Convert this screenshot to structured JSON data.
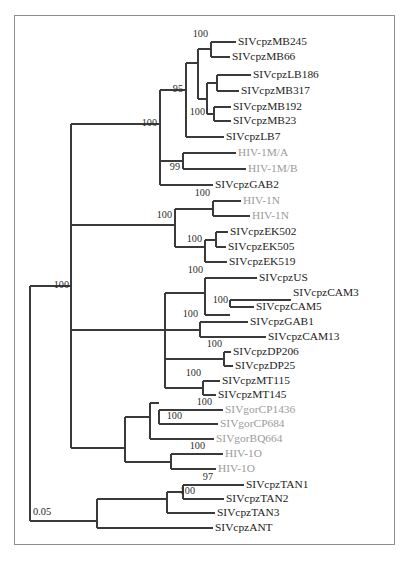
{
  "figure": {
    "type": "phylogenetic-tree",
    "frame": {
      "x": 14,
      "y": 15,
      "width": 381,
      "height": 530,
      "border_color": "#8d8d8d"
    },
    "colors": {
      "branch": "#3a3a3a",
      "tip_text": "#1c1c1c",
      "tip_text_highlight": "#9b9b9b",
      "support_text": "#2b2b2b",
      "background": "#ffffff"
    },
    "scale_bar": {
      "label": "0.05",
      "x1": 30,
      "x2": 70,
      "y": 521,
      "text_x": 33,
      "text_y": 513
    }
  },
  "chart_data": {
    "type": "tree",
    "title": "",
    "orientation": "left-to-right-rectangular",
    "scale_bar_units": 0.05,
    "tip_count": 30,
    "taxa": [
      {
        "label": "SIVcpzMB245",
        "y": 42,
        "x": 238,
        "color": "dark"
      },
      {
        "label": "SIVcpzMB66",
        "y": 57,
        "x": 232,
        "color": "dark"
      },
      {
        "label": "SIVcpzLB186",
        "y": 75,
        "x": 253,
        "color": "dark"
      },
      {
        "label": "SIVcpzMB317",
        "y": 91,
        "x": 241,
        "color": "dark"
      },
      {
        "label": "SIVcpzMB192",
        "y": 107,
        "x": 233,
        "color": "dark"
      },
      {
        "label": "SIVcpzMB23",
        "y": 121,
        "x": 233,
        "color": "dark"
      },
      {
        "label": "SIVcpzLB7",
        "y": 137,
        "x": 226,
        "color": "dark"
      },
      {
        "label": "HIV-1M/A",
        "y": 153,
        "x": 238,
        "color": "gray"
      },
      {
        "label": "HIV-1M/B",
        "y": 169,
        "x": 248,
        "color": "gray"
      },
      {
        "label": "SIVcpzGAB2",
        "y": 185,
        "x": 215,
        "color": "dark"
      },
      {
        "label": "HIV-1N",
        "y": 201,
        "x": 243,
        "color": "gray"
      },
      {
        "label": "HIV-1N",
        "y": 216,
        "x": 252,
        "color": "gray"
      },
      {
        "label": "SIVcpzEK502",
        "y": 232,
        "x": 230,
        "color": "dark"
      },
      {
        "label": "SIVcpzEK505",
        "y": 247,
        "x": 228,
        "color": "dark"
      },
      {
        "label": "SIVcpzEK519",
        "y": 262,
        "x": 229,
        "color": "dark"
      },
      {
        "label": "SIVcpzUS",
        "y": 278,
        "x": 259,
        "color": "dark"
      },
      {
        "label": "SIVcpzCAM3",
        "y": 293,
        "x": 293,
        "color": "dark"
      },
      {
        "label": "SIVcpzCAM5",
        "y": 307,
        "x": 256,
        "color": "dark"
      },
      {
        "label": "SIVcpzGAB1",
        "y": 322,
        "x": 250,
        "color": "dark"
      },
      {
        "label": "SIVcpzCAM13",
        "y": 337,
        "x": 268,
        "color": "dark"
      },
      {
        "label": "SIVcpzDP206",
        "y": 352,
        "x": 233,
        "color": "dark"
      },
      {
        "label": "SIVcpzDP25",
        "y": 366,
        "x": 235,
        "color": "dark"
      },
      {
        "label": "SIVcpzMT115",
        "y": 381,
        "x": 222,
        "color": "dark"
      },
      {
        "label": "SIVcpzMT145",
        "y": 395,
        "x": 218,
        "color": "dark"
      },
      {
        "label": "SIVgorCP1436",
        "y": 410,
        "x": 225,
        "color": "gray"
      },
      {
        "label": "SIVgorCP684",
        "y": 424,
        "x": 220,
        "color": "gray"
      },
      {
        "label": "SIVgorBQ664",
        "y": 439,
        "x": 216,
        "color": "gray"
      },
      {
        "label": "HIV-1O",
        "y": 454,
        "x": 225,
        "color": "gray"
      },
      {
        "label": "HIV-1O",
        "y": 469,
        "x": 218,
        "color": "gray"
      },
      {
        "label": "SIVcpzTAN1",
        "y": 485,
        "x": 246,
        "color": "dark"
      },
      {
        "label": "SIVcpzTAN2",
        "y": 499,
        "x": 226,
        "color": "dark"
      },
      {
        "label": "SIVcpzTAN3",
        "y": 513,
        "x": 217,
        "color": "dark"
      },
      {
        "label": "SIVcpzANT",
        "y": 528,
        "x": 215,
        "color": "dark"
      }
    ],
    "support_values": [
      {
        "value": "100",
        "x": 208,
        "y": 35,
        "anchor": "end"
      },
      {
        "value": "95",
        "x": 183,
        "y": 90,
        "anchor": "end"
      },
      {
        "value": "100",
        "x": 205,
        "y": 113,
        "anchor": "end"
      },
      {
        "value": "100",
        "x": 157,
        "y": 124,
        "anchor": "end"
      },
      {
        "value": "99",
        "x": 180,
        "y": 168,
        "anchor": "end"
      },
      {
        "value": "100",
        "x": 210,
        "y": 194,
        "anchor": "end"
      },
      {
        "value": "100",
        "x": 172,
        "y": 216,
        "anchor": "end"
      },
      {
        "value": "100",
        "x": 202,
        "y": 240,
        "anchor": "end"
      },
      {
        "value": "100",
        "x": 203,
        "y": 271,
        "anchor": "end"
      },
      {
        "value": "100",
        "x": 228,
        "y": 301,
        "anchor": "end"
      },
      {
        "value": "100",
        "x": 198,
        "y": 315,
        "anchor": "end"
      },
      {
        "value": "100",
        "x": 222,
        "y": 345,
        "anchor": "end"
      },
      {
        "value": "100",
        "x": 201,
        "y": 374,
        "anchor": "end"
      },
      {
        "value": "100",
        "x": 212,
        "y": 403,
        "anchor": "end"
      },
      {
        "value": "100",
        "x": 182,
        "y": 417,
        "anchor": "end"
      },
      {
        "value": "100",
        "x": 205,
        "y": 447,
        "anchor": "end"
      },
      {
        "value": "97",
        "x": 213,
        "y": 478,
        "anchor": "end"
      },
      {
        "value": "100",
        "x": 195,
        "y": 492,
        "anchor": "end"
      },
      {
        "value": "100",
        "x": 69,
        "y": 286,
        "anchor": "end"
      }
    ],
    "branches": [
      {
        "id": "root-stem",
        "type": "h",
        "x1": 30,
        "x2": 30,
        "y": 299
      },
      {
        "id": "root-vert",
        "type": "v",
        "x": 30,
        "y1": 286,
        "y2": 521
      },
      {
        "id": "root-to-upper",
        "type": "h",
        "x1": 30,
        "x2": 71,
        "y": 286
      },
      {
        "id": "root-to-lower",
        "type": "h",
        "x1": 30,
        "x2": 97,
        "y": 521
      },
      {
        "id": "n-upper-vert",
        "type": "v",
        "x": 71,
        "y1": 124,
        "y2": 448
      },
      {
        "id": "n-upper-a",
        "type": "h",
        "x1": 71,
        "x2": 160,
        "y": 124
      },
      {
        "id": "n-upper-b",
        "type": "h",
        "x1": 71,
        "x2": 125,
        "y": 448
      },
      {
        "id": "cladeM-vert",
        "type": "v",
        "x": 160,
        "y1": 90,
        "y2": 185
      },
      {
        "id": "cladeM-top",
        "type": "h",
        "x1": 160,
        "x2": 186,
        "y": 90
      },
      {
        "id": "cladeM-gab2",
        "type": "h",
        "x1": 160,
        "x2": 213,
        "y": 185
      },
      {
        "id": "mb-vert",
        "type": "v",
        "x": 186,
        "y1": 63,
        "y2": 137
      },
      {
        "id": "mb-upper",
        "type": "h",
        "x1": 186,
        "x2": 198,
        "y": 63
      },
      {
        "id": "mb-lb7",
        "type": "h",
        "x1": 186,
        "x2": 224,
        "y": 137
      },
      {
        "id": "mbgrp-vert",
        "type": "v",
        "x": 198,
        "y1": 49,
        "y2": 99
      },
      {
        "id": "mbgrp-245",
        "type": "h",
        "x1": 198,
        "x2": 211,
        "y": 49
      },
      {
        "id": "mbgrp-lower",
        "type": "h",
        "x1": 198,
        "x2": 207,
        "y": 99
      },
      {
        "id": "mb245-vert",
        "type": "v",
        "x": 211,
        "y1": 42,
        "y2": 57
      },
      {
        "id": "mb245-t",
        "type": "h",
        "x1": 211,
        "x2": 236,
        "y": 42
      },
      {
        "id": "mb66-t",
        "type": "h",
        "x1": 211,
        "x2": 230,
        "y": 57
      },
      {
        "id": "mb317-vert",
        "type": "v",
        "x": 207,
        "y1": 83,
        "y2": 114
      },
      {
        "id": "mb317-up",
        "type": "h",
        "x1": 207,
        "x2": 217,
        "y": 83
      },
      {
        "id": "mb192-node",
        "type": "h",
        "x1": 207,
        "x2": 214,
        "y": 114
      },
      {
        "id": "lb186-vert",
        "type": "v",
        "x": 217,
        "y1": 75,
        "y2": 91
      },
      {
        "id": "lb186-t",
        "type": "h",
        "x1": 217,
        "x2": 251,
        "y": 75
      },
      {
        "id": "mb317-t",
        "type": "h",
        "x1": 217,
        "x2": 239,
        "y": 91
      },
      {
        "id": "mb192-vert",
        "type": "v",
        "x": 214,
        "y1": 107,
        "y2": 121
      },
      {
        "id": "mb192-t",
        "type": "h",
        "x1": 214,
        "x2": 231,
        "y": 107
      },
      {
        "id": "mb23-t",
        "type": "h",
        "x1": 214,
        "x2": 231,
        "y": 121
      },
      {
        "id": "hivm-vert",
        "type": "v",
        "x": 183,
        "y1": 153,
        "y2": 169
      },
      {
        "id": "hivm-stem",
        "type": "h",
        "x1": 160,
        "x2": 183,
        "y": 161
      },
      {
        "id": "hivm-a",
        "type": "h",
        "x1": 183,
        "x2": 236,
        "y": 153
      },
      {
        "id": "hivm-b",
        "type": "h",
        "x1": 183,
        "x2": 246,
        "y": 169
      },
      {
        "id": "cladeN-stem",
        "type": "h",
        "x1": 71,
        "x2": 175,
        "y": 225
      },
      {
        "id": "cladeN-vert",
        "type": "v",
        "x": 175,
        "y1": 209,
        "y2": 247
      },
      {
        "id": "cladeN-hiv",
        "type": "h",
        "x1": 175,
        "x2": 213,
        "y": 209
      },
      {
        "id": "cladeN-ek",
        "type": "h",
        "x1": 175,
        "x2": 205,
        "y": 247
      },
      {
        "id": "hivn-vert",
        "type": "v",
        "x": 213,
        "y1": 201,
        "y2": 216
      },
      {
        "id": "hivn-1",
        "type": "h",
        "x1": 213,
        "x2": 241,
        "y": 201
      },
      {
        "id": "hivn-2",
        "type": "h",
        "x1": 213,
        "x2": 250,
        "y": 216
      },
      {
        "id": "ek-vert",
        "type": "v",
        "x": 205,
        "y1": 240,
        "y2": 262
      },
      {
        "id": "ek-upper",
        "type": "h",
        "x1": 205,
        "x2": 216,
        "y": 240
      },
      {
        "id": "ek519-t",
        "type": "h",
        "x1": 205,
        "x2": 227,
        "y": 262
      },
      {
        "id": "ek502-vert",
        "type": "v",
        "x": 216,
        "y1": 232,
        "y2": 247
      },
      {
        "id": "ek502-t",
        "type": "h",
        "x1": 216,
        "x2": 228,
        "y": 232
      },
      {
        "id": "ek505-t",
        "type": "h",
        "x1": 216,
        "x2": 226,
        "y": 247
      },
      {
        "id": "cladeC-stem",
        "type": "h",
        "x1": 71,
        "x2": 165,
        "y": 330
      },
      {
        "id": "cladeC-vert",
        "type": "v",
        "x": 165,
        "y1": 293,
        "y2": 388
      },
      {
        "id": "cladeC-us",
        "type": "h",
        "x1": 165,
        "x2": 205,
        "y": 293
      },
      {
        "id": "cladeC-dp",
        "type": "h",
        "x1": 165,
        "x2": 224,
        "y": 359
      },
      {
        "id": "cladeC-mt",
        "type": "h",
        "x1": 165,
        "x2": 203,
        "y": 388
      },
      {
        "id": "us-vert",
        "type": "v",
        "x": 205,
        "y1": 278,
        "y2": 315
      },
      {
        "id": "us-t",
        "type": "h",
        "x1": 205,
        "x2": 257,
        "y": 278
      },
      {
        "id": "us-cam-node",
        "type": "h",
        "x1": 205,
        "x2": 230,
        "y": 315
      },
      {
        "id": "cam-vert",
        "type": "v",
        "x": 230,
        "y1": 300,
        "y2": 307
      },
      {
        "id": "cam3-t",
        "type": "h",
        "x1": 230,
        "x2": 291,
        "y": 300
      },
      {
        "id": "cam5-t",
        "type": "h",
        "x1": 230,
        "x2": 254,
        "y": 307
      },
      {
        "id": "gab1-stem",
        "type": "h",
        "x1": 165,
        "x2": 200,
        "y": 330
      },
      {
        "id": "gab1-vert",
        "type": "v",
        "x": 200,
        "y1": 322,
        "y2": 337
      },
      {
        "id": "gab1-t",
        "type": "h",
        "x1": 200,
        "x2": 248,
        "y": 322
      },
      {
        "id": "cam13-t",
        "type": "h",
        "x1": 200,
        "x2": 266,
        "y": 337
      },
      {
        "id": "dp-vert",
        "type": "v",
        "x": 224,
        "y1": 352,
        "y2": 366
      },
      {
        "id": "dp206-t",
        "type": "h",
        "x1": 224,
        "x2": 231,
        "y": 352
      },
      {
        "id": "dp25-t",
        "type": "h",
        "x1": 224,
        "x2": 233,
        "y": 366
      },
      {
        "id": "mt-vert",
        "type": "v",
        "x": 203,
        "y1": 381,
        "y2": 395
      },
      {
        "id": "mt115-t",
        "type": "h",
        "x1": 203,
        "x2": 220,
        "y": 381
      },
      {
        "id": "mt145-t",
        "type": "h",
        "x1": 203,
        "x2": 216,
        "y": 395
      },
      {
        "id": "gor-main-vert",
        "type": "v",
        "x": 125,
        "y1": 417,
        "y2": 462
      },
      {
        "id": "gor-up",
        "type": "h",
        "x1": 125,
        "x2": 150,
        "y": 417
      },
      {
        "id": "gor-hivo",
        "type": "h",
        "x1": 125,
        "x2": 171,
        "y": 462
      },
      {
        "id": "gorgrp-vert",
        "type": "v",
        "x": 150,
        "y1": 403,
        "y2": 439
      },
      {
        "id": "gorgrp-up",
        "type": "h",
        "x1": 150,
        "x2": 159,
        "y": 403
      },
      {
        "id": "bq664-t",
        "type": "h",
        "x1": 150,
        "x2": 214,
        "y": 439
      },
      {
        "id": "cp-vert",
        "type": "v",
        "x": 159,
        "y1": 410,
        "y2": 424
      },
      {
        "id": "cp1436-t",
        "type": "h",
        "x1": 159,
        "x2": 223,
        "y": 410
      },
      {
        "id": "cp684-t",
        "type": "h",
        "x1": 159,
        "x2": 218,
        "y": 424
      },
      {
        "id": "hivo-vert",
        "type": "v",
        "x": 171,
        "y1": 454,
        "y2": 469
      },
      {
        "id": "hivo-1",
        "type": "h",
        "x1": 171,
        "x2": 223,
        "y": 454
      },
      {
        "id": "hivo-2",
        "type": "h",
        "x1": 171,
        "x2": 216,
        "y": 469
      },
      {
        "id": "tan-main-vert",
        "type": "v",
        "x": 97,
        "y1": 499,
        "y2": 528
      },
      {
        "id": "tan-up",
        "type": "h",
        "x1": 97,
        "x2": 167,
        "y": 499
      },
      {
        "id": "ant-t",
        "type": "h",
        "x1": 97,
        "x2": 213,
        "y": 528
      },
      {
        "id": "tangrp-vert",
        "type": "v",
        "x": 167,
        "y1": 492,
        "y2": 513
      },
      {
        "id": "tangrp-up",
        "type": "h",
        "x1": 167,
        "x2": 183,
        "y": 492
      },
      {
        "id": "tan3-t",
        "type": "h",
        "x1": 167,
        "x2": 215,
        "y": 513
      },
      {
        "id": "tan12-vert",
        "type": "v",
        "x": 183,
        "y1": 485,
        "y2": 499
      },
      {
        "id": "tan1-t",
        "type": "h",
        "x1": 183,
        "x2": 244,
        "y": 485
      },
      {
        "id": "tan2-t",
        "type": "h",
        "x1": 183,
        "x2": 224,
        "y": 499
      }
    ]
  }
}
